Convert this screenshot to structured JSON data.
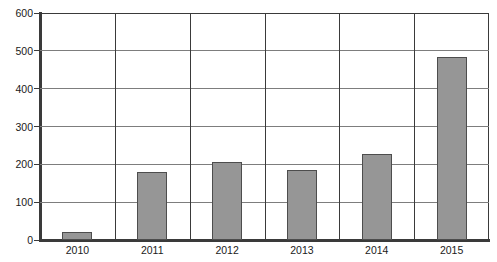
{
  "chart_data": {
    "type": "bar",
    "title": "",
    "subtitle": "",
    "xlabel": "",
    "ylabel": "",
    "categories": [
      "2010",
      "2011",
      "2012",
      "2013",
      "2014",
      "2015"
    ],
    "values": [
      22,
      180,
      207,
      186,
      228,
      484
    ],
    "ylim": [
      0,
      600
    ],
    "yticks": [
      0,
      100,
      200,
      300,
      400,
      500,
      600
    ],
    "ytick_labels": [
      "0",
      "100",
      "200",
      "300",
      "400",
      "500",
      "600"
    ],
    "grid": true,
    "grid_axis": "y",
    "legend": false,
    "legend_position": "none",
    "annotations": [],
    "colors": {
      "bar_fill": "#969696",
      "bar_edge": "#4d4d4d",
      "gridline": "#7d7d7d",
      "axis": "#3a3a3a",
      "plot_background": "#ffffff",
      "text": "#1a1a1a"
    }
  }
}
